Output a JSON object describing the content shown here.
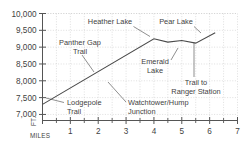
{
  "chart_data": {
    "type": "line",
    "title": "",
    "subtitle": "",
    "xlabel": "MILES",
    "ylabel": "FT.",
    "xlim": [
      0,
      7
    ],
    "ylim": [
      6820,
      10000
    ],
    "grid": true,
    "legend_position": "none",
    "x_ticks": [
      0,
      1,
      2,
      3,
      4,
      5,
      6,
      7
    ],
    "x_tick_labels": [
      "",
      "1",
      "2",
      "3",
      "4",
      "5",
      "6",
      "7"
    ],
    "x_minor_ticks": [
      0.5,
      1.5,
      2.5,
      3.5,
      4.5,
      5.5,
      6.5
    ],
    "y_ticks": [
      7000,
      7500,
      8000,
      8500,
      9000,
      9500,
      10000
    ],
    "y_tick_labels": [
      "7,000",
      "7,500",
      "8,000",
      "8,500",
      "9,000",
      "9,500",
      "10,000"
    ],
    "series": [
      {
        "name": "Trail elevation profile",
        "x": [
          0,
          4,
          4.5,
          5,
          5.5,
          6.2
        ],
        "values": [
          7300,
          9250,
          9150,
          9200,
          9120,
          9430
        ]
      }
    ],
    "annotations": [
      {
        "id": "heather-lake",
        "label_line1": "Heather Lake",
        "label_line2": "",
        "points_to_x": 4,
        "points_to_y": 9250
      },
      {
        "id": "pear-lake",
        "label_line1": "Pear Lake",
        "label_line2": "",
        "points_to_x": 6.2,
        "points_to_y": 9430
      },
      {
        "id": "panther-gap-trail",
        "label_line1": "Panther Gap",
        "label_line2": "Trail",
        "points_to_x": 2.0,
        "points_to_y": 8280
      },
      {
        "id": "emerald-lake",
        "label_line1": "Emerald",
        "label_line2": "Lake",
        "points_to_x": 5.0,
        "points_to_y": 9200
      },
      {
        "id": "trail-to-ranger-station",
        "label_line1": "Trail to",
        "label_line2": "Ranger Station",
        "points_to_x": 5.5,
        "points_to_y": 9120
      },
      {
        "id": "lodgepole-trail",
        "label_line1": "Lodgepole",
        "label_line2": "Trail",
        "points_to_x": 0.0,
        "points_to_y": 7300
      },
      {
        "id": "watchtower-hump-junction",
        "label_line1": "Watchtower/Hump",
        "label_line2": "Junction",
        "points_to_x": 2.55,
        "points_to_y": 8560
      }
    ],
    "colors": {
      "line": "#4a4a4a",
      "frame": "#555555",
      "grid": "#c9c9c9",
      "text": "#3f3f3f",
      "background": "#ffffff"
    }
  },
  "axis": {
    "y_label": "FT.",
    "x_label": "MILES"
  }
}
